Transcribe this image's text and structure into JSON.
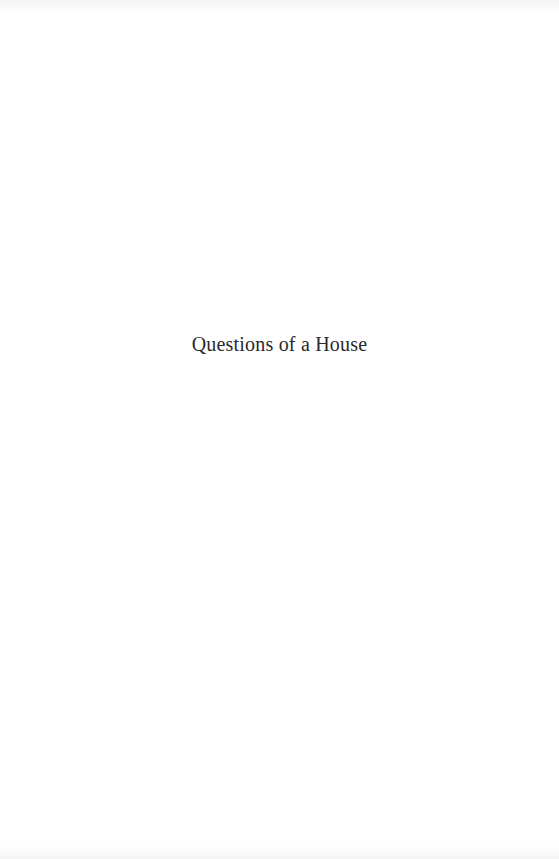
{
  "page": {
    "half_title": "Questions of a House"
  }
}
